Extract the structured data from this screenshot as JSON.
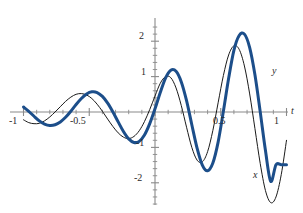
{
  "chart_data": {
    "type": "line",
    "title": "",
    "subtitle": "",
    "xlabel": "t",
    "ylabel": "",
    "xlim": [
      -1.06,
      1.06
    ],
    "ylim": [
      -2.75,
      2.45
    ],
    "grid": false,
    "legend_position": "inline-curve-labels",
    "x_ticks_major": [
      -1,
      -0.5,
      0,
      0.5,
      1
    ],
    "x_tick_labels": [
      "-1",
      "-0.5",
      "0.5",
      "1"
    ],
    "x_minor_tick_step": 0.1,
    "y_ticks_major": [
      -2,
      -1,
      0,
      1,
      2
    ],
    "y_tick_labels": [
      "2",
      "1",
      "-1",
      "-2"
    ],
    "y_minor_tick_step": 0.2,
    "axis_color": "#8a8a8a",
    "series": [
      {
        "name": "x",
        "label": "x",
        "color": "#1a1a1a",
        "width": 1.0,
        "style": "thin-black",
        "description": "exponentially growing sinusoid, lags y",
        "x": [
          -1.0,
          -0.96,
          -0.92,
          -0.88,
          -0.84,
          -0.8,
          -0.76,
          -0.72,
          -0.68,
          -0.64,
          -0.6,
          -0.56,
          -0.52,
          -0.48,
          -0.44,
          -0.4,
          -0.36,
          -0.32,
          -0.28,
          -0.24,
          -0.2,
          -0.16,
          -0.12,
          -0.08,
          -0.04,
          0.0,
          0.04,
          0.08,
          0.12,
          0.16,
          0.2,
          0.24,
          0.28,
          0.32,
          0.36,
          0.4,
          0.44,
          0.48,
          0.52,
          0.56,
          0.6,
          0.64,
          0.68,
          0.72,
          0.76,
          0.8,
          0.84,
          0.88,
          0.92,
          0.96,
          1.0
        ],
        "y": [
          -0.22,
          -0.3,
          -0.33,
          -0.32,
          -0.25,
          -0.14,
          0.0,
          0.15,
          0.3,
          0.42,
          0.5,
          0.52,
          0.48,
          0.38,
          0.22,
          0.02,
          -0.2,
          -0.41,
          -0.59,
          -0.71,
          -0.75,
          -0.69,
          -0.53,
          -0.27,
          0.07,
          0.45,
          0.81,
          1.0,
          0.97,
          0.68,
          0.18,
          -0.43,
          -1.0,
          -1.36,
          -1.41,
          -1.12,
          -0.52,
          0.26,
          1.03,
          1.61,
          1.87,
          1.77,
          1.3,
          0.51,
          -0.47,
          -1.45,
          -2.22,
          -2.56,
          -2.4,
          -1.77,
          -0.8
        ],
        "key_points": {
          "local_max_near_t_-0.55": 0.52,
          "local_min_near_t_-0.20": -0.75,
          "local_max_near_t_0.07": 1.0,
          "local_min_near_t_0.36": -1.42,
          "local_max_near_t_0.65": 1.88,
          "local_min_near_t_0.93": -2.56
        }
      },
      {
        "name": "y",
        "label": "y",
        "color": "#1c4e8a",
        "width": 3.0,
        "style": "thick-blue",
        "description": "exponentially growing sinusoid, leads x by about a quarter period",
        "x": [
          -1.0,
          -0.96,
          -0.92,
          -0.88,
          -0.84,
          -0.8,
          -0.76,
          -0.72,
          -0.68,
          -0.64,
          -0.6,
          -0.56,
          -0.52,
          -0.48,
          -0.44,
          -0.4,
          -0.36,
          -0.32,
          -0.28,
          -0.24,
          -0.2,
          -0.16,
          -0.12,
          -0.08,
          -0.04,
          0.0,
          0.04,
          0.08,
          0.12,
          0.16,
          0.2,
          0.24,
          0.28,
          0.32,
          0.36,
          0.4,
          0.44,
          0.48,
          0.52,
          0.56,
          0.6,
          0.64,
          0.68,
          0.72,
          0.76,
          0.8,
          0.84,
          0.88,
          0.92,
          0.96,
          1.0
        ],
        "y": [
          0.14,
          0.02,
          -0.12,
          -0.25,
          -0.34,
          -0.38,
          -0.36,
          -0.28,
          -0.15,
          0.02,
          0.21,
          0.38,
          0.51,
          0.57,
          0.55,
          0.44,
          0.25,
          0.0,
          -0.28,
          -0.55,
          -0.76,
          -0.86,
          -0.83,
          -0.65,
          -0.33,
          0.09,
          0.55,
          0.96,
          1.18,
          1.15,
          0.85,
          0.32,
          -0.36,
          -1.02,
          -1.5,
          -1.66,
          -1.44,
          -0.85,
          0.02,
          0.95,
          1.74,
          2.16,
          2.2,
          1.82,
          1.05,
          0.01,
          -1.09,
          -1.96,
          -1.49,
          -1.49,
          -1.49
        ],
        "key_points": {
          "local_min_near_t_-0.80": -0.38,
          "local_max_near_t_-0.47": 0.57,
          "local_min_near_t_-0.16": -0.87,
          "local_max_near_t_0.13": 1.18,
          "local_min_near_t_0.40": -1.66,
          "local_max_near_t_0.68": 2.21
        }
      }
    ]
  },
  "axis": {
    "x_name": "t",
    "labels": {
      "x_neg_one": "-1",
      "x_neg_half": "-0.5",
      "x_half": "0.5",
      "x_one": "1",
      "y_two": "2",
      "y_one": "1",
      "y_neg_one": "-1",
      "y_neg_two": "-2"
    }
  },
  "curve_labels": {
    "y_curve": "y",
    "x_curve": "x"
  },
  "colors": {
    "blue": "#1c4e8a",
    "black": "#1a1a1a",
    "axis": "#8a8a8a",
    "background": "#ffffff"
  }
}
